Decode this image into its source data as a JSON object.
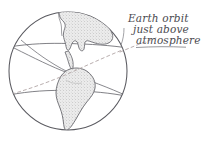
{
  "figure": {
    "kind": "hand-drawn-sketch",
    "background_color": "#ffffff",
    "ink_color": "#5a5a60",
    "land_fill_color": "#e3e3e3",
    "orbit_color": "#b0a8a8",
    "width": 204,
    "height": 149
  },
  "annotation": {
    "name": "orbit-callout",
    "full_text": "Earth orbit just above atmosphere",
    "lines": [
      "Earth orbit",
      "just above",
      "atmosphere"
    ],
    "style": "handwritten-italic",
    "color": "#4a4a50"
  },
  "globe": {
    "label": "earth-globe",
    "center_x": 68,
    "center_y": 71,
    "radius": 59,
    "outline_color": "#5a5a60",
    "latitude_lines": [
      {
        "name": "upper-latitude",
        "y": 46
      },
      {
        "name": "lower-latitude",
        "y": 92
      }
    ],
    "meridian": {
      "name": "central-meridian",
      "tilt": "oblique"
    }
  },
  "continents": [
    {
      "name": "north-america",
      "fill": "#e6e6e6",
      "shading": "stipple"
    },
    {
      "name": "south-america",
      "fill": "#e6e6e6",
      "shading": "stipple"
    }
  ],
  "orbit_path": {
    "name": "orbit-dashed-line",
    "style": "dashed",
    "color": "#b5aaaa",
    "dash_pattern": "3 3",
    "description": "low orbit arc crossing globe"
  }
}
